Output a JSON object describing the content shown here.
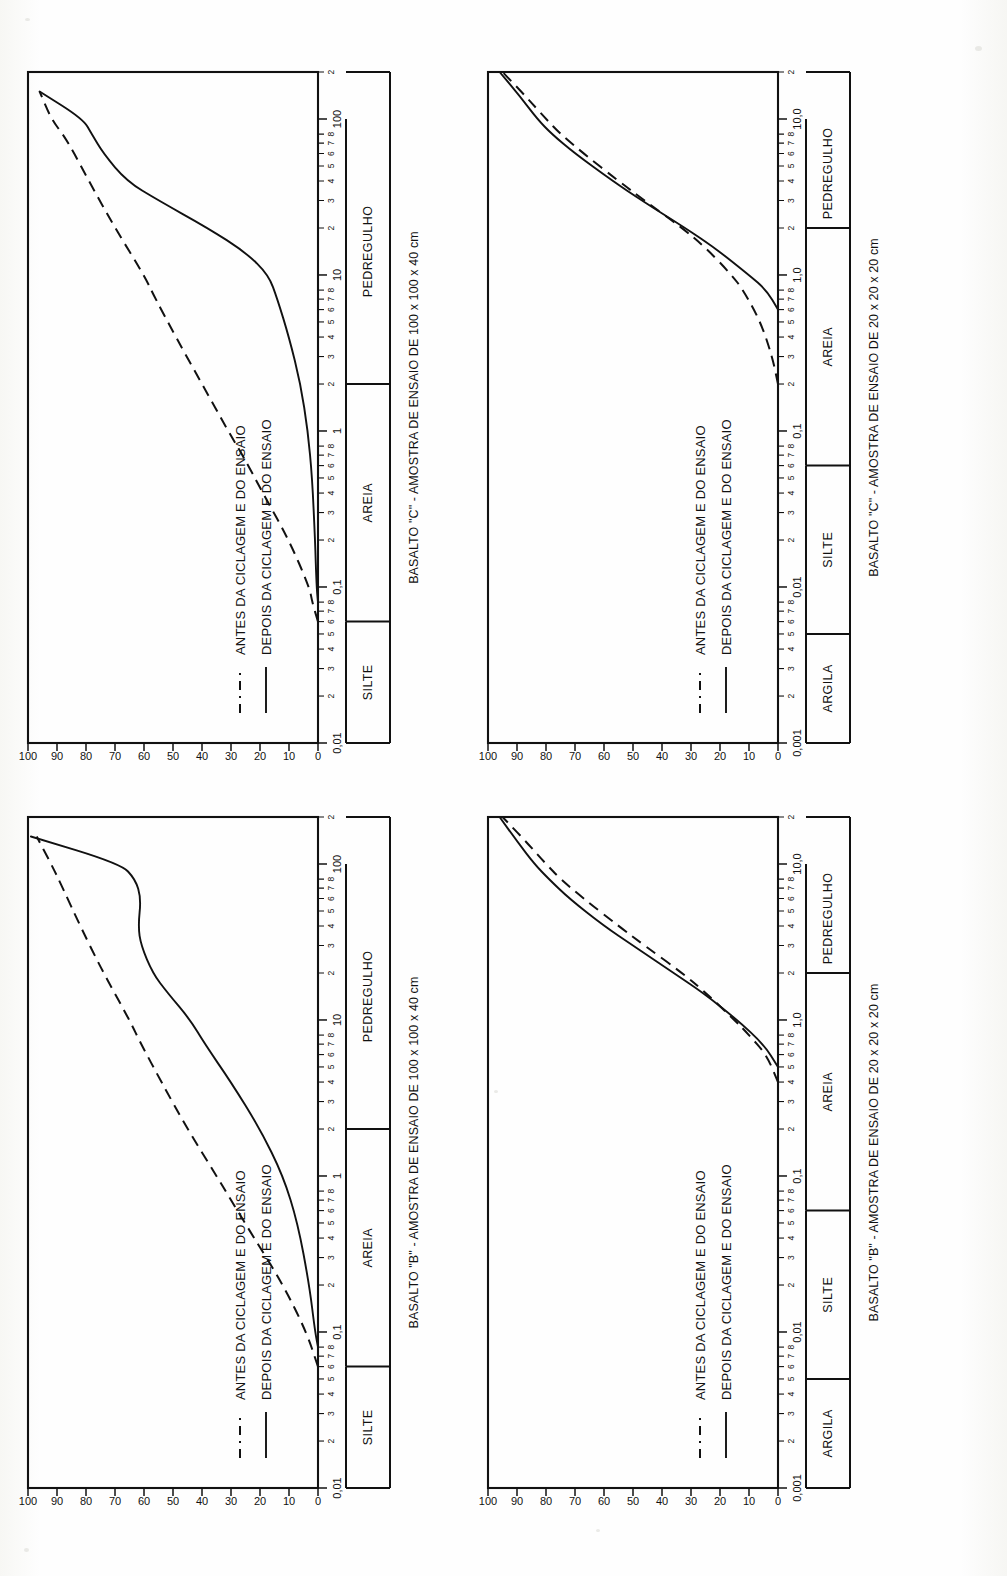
{
  "document": {
    "kind": "scanned-figure-page",
    "description": "Quatro curvas granulometricas de basalto antes e depois da ciclagem e do ensaio",
    "orientation": "charts rotated 90 degrees counter-clockwise",
    "ink_color": "#111111",
    "paper_color": "#fdfdfb"
  },
  "legend": {
    "entries": [
      {
        "label": "ANTES DA CICLAGEM E DO ENSAIO",
        "style": "dashed"
      },
      {
        "label": "DEPOIS DA CICLAGEM E DO ENSAIO",
        "style": "solid"
      }
    ]
  },
  "axes": {
    "y_ticks": [
      "100",
      "90",
      "80",
      "70",
      "60",
      "50",
      "40",
      "30",
      "20",
      "10",
      "0"
    ],
    "y_label": "",
    "minor_ticks": [
      "2",
      "3",
      "4",
      "5",
      "6",
      "7",
      "8"
    ]
  },
  "charts": [
    {
      "id": "top-left",
      "title": "BASALTO \"C\" - AMOSTRA DE ENSAIO DE 100 x 100 x 40 cm",
      "scale": "coarse",
      "decade_labels": [
        "0,01",
        "0,1",
        "1",
        "10",
        "100"
      ],
      "categories": [
        {
          "label": "SILTE",
          "from": "0,01",
          "to": "0,06"
        },
        {
          "label": "AREIA",
          "from": "0,06",
          "to": "2"
        },
        {
          "label": "PEDREGULHO",
          "from": "2",
          "to": "100"
        }
      ],
      "chart_data": {
        "type": "line",
        "title": "BASALTO \"C\" - AMOSTRA DE ENSAIO DE 100 x 100 x 40 cm",
        "xlabel": "Diametro dos graos (mm)",
        "ylabel": "Porcentagem que passa (%)",
        "xscale": "log",
        "xlim": [
          0.01,
          200
        ],
        "ylim": [
          0,
          100
        ],
        "grid": false,
        "legend": "inside-left",
        "series": [
          {
            "name": "ANTES DA CICLAGEM E DO ENSAIO",
            "style": "dashed",
            "x": [
              0.06,
              0.08,
              0.1,
              0.2,
              0.4,
              0.7,
              1.0,
              2.0,
              4.0,
              7.0,
              10,
              20,
              40,
              60,
              80,
              100,
              150
            ],
            "y": [
              0,
              2,
              3,
              10,
              19,
              26,
              31,
              40,
              49,
              56,
              60,
              70,
              79,
              84,
              88,
              92,
              96
            ]
          },
          {
            "name": "DEPOIS DA CICLAGEM E DO ENSAIO",
            "style": "solid",
            "x": [
              0.08,
              0.1,
              0.2,
              0.5,
              1.0,
              2.0,
              4.0,
              7.0,
              10,
              14,
              20,
              30,
              40,
              60,
              80,
              100,
              150
            ],
            "y": [
              0,
              0.5,
              1,
              2,
              3.5,
              6,
              10,
              14,
              17,
              25,
              38,
              55,
              66,
              74,
              78,
              81,
              96
            ]
          }
        ]
      }
    },
    {
      "id": "top-right",
      "title": "BASALTO \"C\" - AMOSTRA DE ENSAIO DE 20 x 20 x 20 cm",
      "scale": "fine",
      "decade_labels": [
        "0,001",
        "0,01",
        "0,1",
        "1,0",
        "10,0"
      ],
      "categories": [
        {
          "label": "ARGILA",
          "from": "0,001",
          "to": "0,005"
        },
        {
          "label": "SILTE",
          "from": "0,005",
          "to": "0,06"
        },
        {
          "label": "AREIA",
          "from": "0,06",
          "to": "2"
        },
        {
          "label": "PEDREGULHO",
          "from": "2",
          "to": "10"
        }
      ],
      "chart_data": {
        "type": "line",
        "title": "BASALTO \"C\" - AMOSTRA DE ENSAIO DE 20 x 20 x 20 cm",
        "xlabel": "Diametro dos graos (mm)",
        "ylabel": "Porcentagem que passa (%)",
        "xscale": "log",
        "xlim": [
          0.001,
          20
        ],
        "ylim": [
          0,
          100
        ],
        "grid": false,
        "legend": "inside-left",
        "series": [
          {
            "name": "ANTES DA CICLAGEM E DO ENSAIO",
            "style": "dashed",
            "x": [
              0.2,
              0.3,
              0.5,
              0.8,
              1.0,
              1.5,
              2.0,
              3.0,
              4.0,
              6.0,
              8.0,
              10,
              14,
              20
            ],
            "y": [
              0,
              2,
              6,
              12,
              16,
              25,
              33,
              46,
              55,
              67,
              75,
              80,
              87,
              95
            ]
          },
          {
            "name": "DEPOIS DA CICLAGEM E DO ENSAIO",
            "style": "solid",
            "x": [
              0.6,
              0.8,
              1.0,
              1.5,
              2.0,
              3.0,
              4.0,
              6.0,
              8.0,
              10,
              14,
              20
            ],
            "y": [
              0,
              4,
              10,
              22,
              32,
              47,
              57,
              70,
              78,
              83,
              89,
              96
            ]
          }
        ]
      }
    },
    {
      "id": "bottom-left",
      "title": "BASALTO \"B\" - AMOSTRA DE ENSAIO DE 100 x 100 x 40 cm",
      "scale": "coarse",
      "decade_labels": [
        "0,01",
        "0,1",
        "1",
        "10",
        "100"
      ],
      "categories": [
        {
          "label": "SILTE",
          "from": "0,01",
          "to": "0,06"
        },
        {
          "label": "AREIA",
          "from": "0,06",
          "to": "2"
        },
        {
          "label": "PEDREGULHO",
          "from": "2",
          "to": "100"
        }
      ],
      "chart_data": {
        "type": "line",
        "title": "BASALTO \"B\" - AMOSTRA DE ENSAIO DE 100 x 100 x 40 cm",
        "xlabel": "Diametro dos graos (mm)",
        "ylabel": "Porcentagem que passa (%)",
        "xscale": "log",
        "xlim": [
          0.01,
          200
        ],
        "ylim": [
          0,
          100
        ],
        "grid": false,
        "legend": "inside-left",
        "series": [
          {
            "name": "ANTES DA CICLAGEM E DO ENSAIO",
            "style": "dashed",
            "x": [
              0.06,
              0.1,
              0.2,
              0.4,
              0.7,
              1.0,
              2.0,
              4.0,
              7.0,
              10,
              20,
              40,
              70,
              100,
              150
            ],
            "y": [
              0,
              4,
              12,
              22,
              30,
              35,
              45,
              54,
              61,
              65,
              74,
              82,
              88,
              92,
              97
            ]
          },
          {
            "name": "DEPOIS DA CICLAGEM E DO ENSAIO",
            "style": "solid",
            "x": [
              0.08,
              0.1,
              0.2,
              0.5,
              1.0,
              2.0,
              4.0,
              7.0,
              10,
              15,
              20,
              30,
              40,
              60,
              80,
              100,
              150
            ],
            "y": [
              0,
              1,
              3,
              7,
              12,
              20,
              30,
              39,
              44,
              52,
              57,
              61,
              62,
              61,
              63,
              68,
              99
            ]
          }
        ]
      }
    },
    {
      "id": "bottom-right",
      "title": "BASALTO \"B\" - AMOSTRA DE ENSAIO DE 20 x 20 x 20 cm",
      "scale": "fine",
      "decade_labels": [
        "0,001",
        "0,01",
        "0,1",
        "1,0",
        "10,0"
      ],
      "categories": [
        {
          "label": "ARGILA",
          "from": "0,001",
          "to": "0,005"
        },
        {
          "label": "SILTE",
          "from": "0,005",
          "to": "0,06"
        },
        {
          "label": "AREIA",
          "from": "0,06",
          "to": "2"
        },
        {
          "label": "PEDREGULHO",
          "from": "2",
          "to": "10"
        }
      ],
      "chart_data": {
        "type": "line",
        "title": "BASALTO \"B\" - AMOSTRA DE ENSAIO DE 20 x 20 x 20 cm",
        "xlabel": "Diametro dos graos (mm)",
        "ylabel": "Porcentagem que passa (%)",
        "xscale": "log",
        "xlim": [
          0.001,
          20
        ],
        "ylim": [
          0,
          100
        ],
        "grid": false,
        "legend": "inside-left",
        "series": [
          {
            "name": "ANTES DA CICLAGEM E DO ENSAIO",
            "style": "dashed",
            "x": [
              0.4,
              0.6,
              0.8,
              1.0,
              1.5,
              2.0,
              3.0,
              4.0,
              6.0,
              8.0,
              10,
              14,
              20
            ],
            "y": [
              0,
              4,
              10,
              15,
              25,
              33,
              46,
              55,
              67,
              75,
              80,
              87,
              95
            ]
          },
          {
            "name": "DEPOIS DA CICLAGEM E DO ENSAIO",
            "style": "solid",
            "x": [
              0.5,
              0.7,
              1.0,
              1.5,
              2.0,
              3.0,
              4.0,
              6.0,
              8.0,
              10,
              14,
              20
            ],
            "y": [
              0,
              5,
              14,
              26,
              36,
              50,
              60,
              72,
              79,
              84,
              90,
              96
            ]
          }
        ]
      }
    }
  ]
}
